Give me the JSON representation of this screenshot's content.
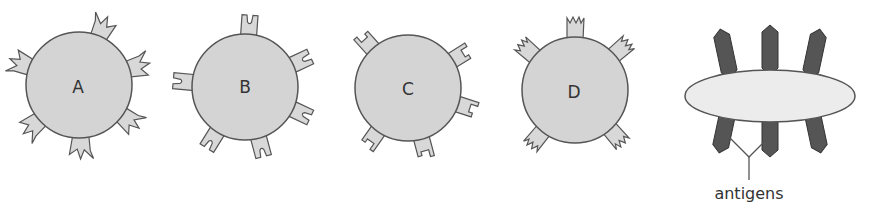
{
  "diagram": {
    "cells": [
      {
        "label": "A",
        "receptor_shape": "zigzag-notch"
      },
      {
        "label": "B",
        "receptor_shape": "rounded-u-notch"
      },
      {
        "label": "C",
        "receptor_shape": "square-notch"
      },
      {
        "label": "D",
        "receptor_shape": "crown-notch"
      }
    ],
    "bacterium": {
      "antigen_label": "antigens"
    },
    "colors": {
      "cell_fill": "#d4d4d4",
      "receptor_fill": "#d8d8d8",
      "outline": "#555555",
      "bacterium_fill": "#ececec",
      "antigen_fill": "#555555"
    }
  }
}
